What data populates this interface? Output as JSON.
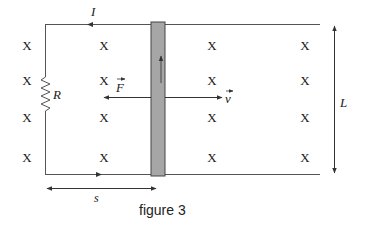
{
  "figure": {
    "caption": "figure 3",
    "current_label": "I",
    "resistor_label": "R",
    "force_label": "F",
    "velocity_label": "v",
    "length_label": "L",
    "distance_label": "s",
    "field_symbol": "X"
  },
  "colors": {
    "wire": "#555555",
    "rod_fill": "#a6a6a6",
    "rod_stroke": "#444444",
    "text": "#1a1a1a"
  },
  "field_marks": [
    {
      "x": 27,
      "y": 45
    },
    {
      "x": 104,
      "y": 45
    },
    {
      "x": 212,
      "y": 45
    },
    {
      "x": 305,
      "y": 45
    },
    {
      "x": 27,
      "y": 80
    },
    {
      "x": 104,
      "y": 80
    },
    {
      "x": 212,
      "y": 80
    },
    {
      "x": 305,
      "y": 80
    },
    {
      "x": 27,
      "y": 117
    },
    {
      "x": 104,
      "y": 117
    },
    {
      "x": 212,
      "y": 117
    },
    {
      "x": 305,
      "y": 117
    },
    {
      "x": 27,
      "y": 157
    },
    {
      "x": 104,
      "y": 157
    },
    {
      "x": 212,
      "y": 157
    },
    {
      "x": 305,
      "y": 157
    }
  ]
}
